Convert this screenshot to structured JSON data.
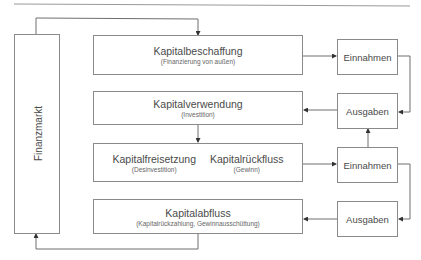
{
  "diagram": {
    "left_box": {
      "label": "Finanzmarkt"
    },
    "main_boxes": [
      {
        "title": "Kapitalbeschaffung",
        "subtitle": "(Finanzierung von außen)"
      },
      {
        "title": "Kapitalverwendung",
        "subtitle": "(Investition)"
      },
      {
        "left": {
          "title": "Kapitalfreisetzung",
          "subtitle": "(Desinvestition)"
        },
        "right": {
          "title": "Kapitalrückfluss",
          "subtitle": "(Gewinn)"
        }
      },
      {
        "title": "Kapitalabfluss",
        "subtitle": "(Kapitalrückzahlung, Gewinnausschüttung)"
      }
    ],
    "right_boxes": [
      {
        "label": "Einnahmen"
      },
      {
        "label": "Ausgaben"
      },
      {
        "label": "Einnahmen"
      },
      {
        "label": "Ausgaben"
      }
    ],
    "colors": {
      "line": "#6e6e6e",
      "border": "#8a8a8a",
      "text": "#4a4a4a"
    }
  }
}
